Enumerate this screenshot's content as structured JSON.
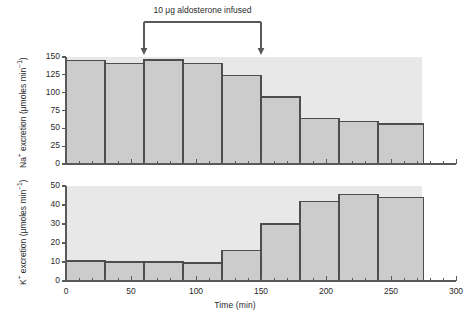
{
  "chart_data": {
    "type": "bar",
    "title": "",
    "annotation": "10 μg aldosterone infused",
    "annotation_arrows_at_time": [
      60,
      150
    ],
    "xlabel": "Time (min)",
    "xlim": [
      0,
      300
    ],
    "xticks": [
      0,
      50,
      100,
      150,
      200,
      250,
      300
    ],
    "xtick_labels": [
      "0",
      "50",
      "100",
      "150",
      "200",
      "250",
      "300"
    ],
    "xminor_step": 10,
    "grid": false,
    "legend": "none",
    "bin_edges": [
      0,
      30,
      60,
      90,
      120,
      150,
      180,
      210,
      240,
      275
    ],
    "panels": [
      {
        "name": "sodium-panel",
        "ylabel": "Na⁺ excretion (μmoles min⁻¹)",
        "ylabel_text": "Na",
        "ylabel_sup": "+",
        "ylabel_rest": " excretion (μmoles min",
        "ylabel_sup2": "−1",
        "ylabel_end": ")",
        "ylim": [
          0,
          150
        ],
        "yticks": [
          0,
          25,
          50,
          75,
          100,
          125,
          150
        ],
        "ytick_labels": [
          "0",
          "25",
          "50",
          "75",
          "100",
          "125",
          "150"
        ],
        "values": [
          145,
          141,
          146,
          141,
          124,
          94,
          64,
          60,
          56
        ]
      },
      {
        "name": "potassium-panel",
        "ylabel": "K⁺ excretion (μmoles min⁻¹)",
        "ylabel_text": "K",
        "ylabel_sup": "+",
        "ylabel_rest": " excretion (μmoles min",
        "ylabel_sup2": "−1",
        "ylabel_end": ")",
        "ylim": [
          0,
          50
        ],
        "yticks": [
          0,
          10,
          20,
          30,
          40,
          50
        ],
        "ytick_labels": [
          "0",
          "10",
          "20",
          "30",
          "40",
          "50"
        ],
        "values": [
          10.5,
          10,
          10,
          9.5,
          16,
          30,
          42,
          45.5,
          44
        ]
      }
    ],
    "colors": {
      "bar_fill": "#cccccc",
      "bar_stroke": "#4d4d4d",
      "axis": "#595959",
      "panel_bg": "#e8e8e8",
      "text": "#2a2a2a"
    }
  }
}
